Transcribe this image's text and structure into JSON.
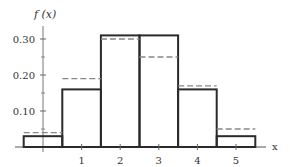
{
  "chart_data": {
    "type": "bar",
    "title": "",
    "xlabel": "x",
    "ylabel": "f (x)",
    "categories": [
      0,
      1,
      2,
      3,
      4,
      5
    ],
    "series": [
      {
        "name": "histogram (solid)",
        "style": "solid",
        "values": [
          0.03,
          0.16,
          0.31,
          0.31,
          0.16,
          0.03
        ]
      },
      {
        "name": "comparison (dashed)",
        "style": "dashed",
        "values": [
          0.04,
          0.19,
          0.3,
          0.25,
          0.17,
          0.05
        ]
      }
    ],
    "x_ticks": [
      "1",
      "2",
      "3",
      "4",
      "5"
    ],
    "y_ticks": [
      "0.10",
      "0.20",
      "0.30"
    ],
    "y_minor_ticks": [
      0.05,
      0.15,
      0.25
    ],
    "xlim": [
      -0.5,
      5.5
    ],
    "ylim": [
      0,
      0.33
    ],
    "grid": false,
    "legend": "none"
  },
  "labels": {
    "y_axis": "f (x)",
    "x_axis": "x"
  }
}
